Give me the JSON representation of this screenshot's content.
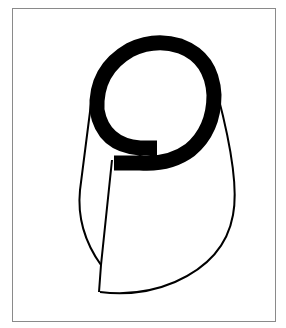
{
  "figure": {
    "frame": {
      "color": "#8a8a8a",
      "x": 12,
      "y": 8,
      "width": 264,
      "height": 314
    },
    "colors": {
      "background": "#ffffff",
      "ink": "#000000"
    },
    "elements": [
      {
        "name": "spiral-ring",
        "type": "thick-stroke-spiral"
      },
      {
        "name": "cone-outline",
        "type": "curved-outline"
      },
      {
        "name": "inner-fold-line",
        "type": "line"
      }
    ]
  }
}
